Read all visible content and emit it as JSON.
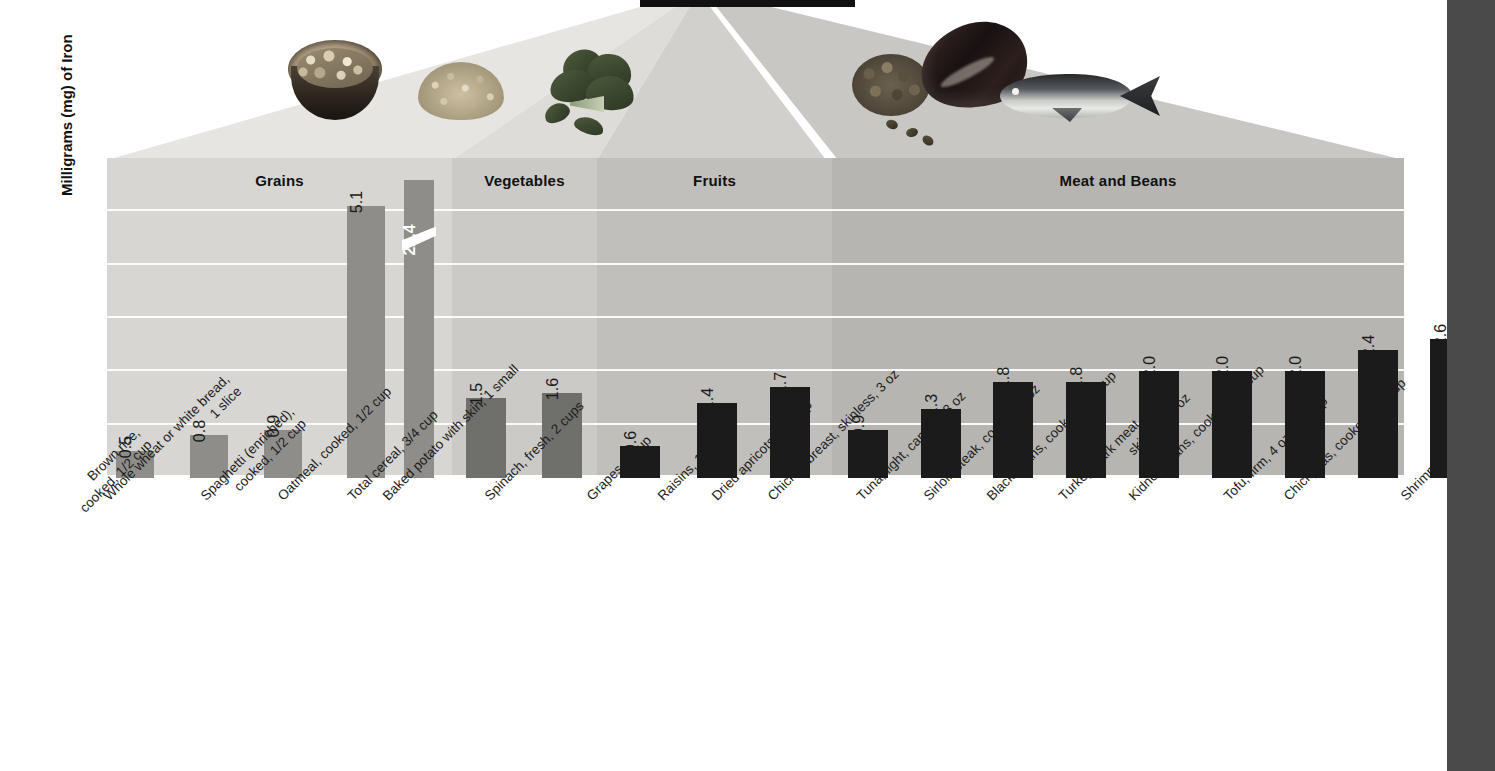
{
  "chart_data": {
    "type": "bar",
    "title": "",
    "ylabel": "Milligrams (mg) of Iron",
    "xlabel": "",
    "ylim": [
      0,
      6
    ],
    "grid": true,
    "axis_break": {
      "present": true,
      "bar_index": 4,
      "note": "Total cereal bar is truncated with a diagonal break"
    },
    "groups": [
      {
        "name": "Grains",
        "count": 5
      },
      {
        "name": "Vegetables",
        "count": 2
      },
      {
        "name": "Fruits",
        "count": 3
      },
      {
        "name": "Meat and Beans",
        "count": 10
      }
    ],
    "categories": [
      "Brown rice, cooked, 1/2 cup",
      "Whole wheat or white bread, 1 slice",
      "Spaghetti (enriched), cooked, 1/2 cup",
      "Oatmeal, cooked, 1/2 cup",
      "Total cereal, 3/4 cup",
      "Baked potato with skin, 1 small",
      "Spinach, fresh, 2 cups",
      "Grapes, 1 cup",
      "Raisins, 1/2 cup",
      "Dried apricots, 1/2 cup",
      "Chicken breast, skinless, 3 oz",
      "Tuna, light, canned, 3 oz",
      "Sirloin steak, cooked, 3 oz",
      "Black beans, cooked, 1/2 cup",
      "Turkey, dark meat, cooked, skinless, 3 oz",
      "Kidney beans, cooked, 1/2 cup",
      "Tofu, firm, 4 oz, 1/2 cup",
      "Chickpeas, cooked, 1/2 cup",
      "Shrimp, 3 oz"
    ],
    "values": [
      0.5,
      0.8,
      0.9,
      5.1,
      22.4,
      1.5,
      1.6,
      0.6,
      1.4,
      1.7,
      0.9,
      1.3,
      1.8,
      1.8,
      2.0,
      2.0,
      2.0,
      2.4,
      2.6
    ],
    "value_labels": [
      "0.5",
      "0.8",
      "0.9",
      "5.1",
      "22.4",
      "1.5",
      "1.6",
      "0.6",
      "1.4",
      "1.7",
      "0.9",
      "1.3",
      "1.8",
      "1.8",
      "2.0",
      "2.0",
      "2.0",
      "2.4",
      "2.6"
    ]
  },
  "category_labels_wrapped": [
    [
      "Brown rice,",
      "cooked, 1/2 cup"
    ],
    [
      "Whole wheat or white bread,",
      "1 slice"
    ],
    [
      "Spaghetti (enriched),",
      "cooked, 1/2 cup"
    ],
    [
      "Oatmeal, cooked, 1/2 cup"
    ],
    [
      "Total cereal, 3/4 cup"
    ],
    [
      "Baked potato with skin, 1 small"
    ],
    [
      "Spinach, fresh, 2 cups"
    ],
    [
      "Grapes, 1 cup"
    ],
    [
      "Raisins, 1/2 cup"
    ],
    [
      "Dried apricots, 1/2 cup"
    ],
    [
      "Chicken breast, skinless, 3 oz"
    ],
    [
      "Tuna, light, canned, 3 oz"
    ],
    [
      "Sirloin steak, cooked, 3 oz"
    ],
    [
      "Black beans, cooked, 1/2 cup"
    ],
    [
      "Turkey, dark meat, cooked,",
      "skinless, 3 oz"
    ],
    [
      "Kidney beans, cooked, 1/2 cup"
    ],
    [
      "Tofu, firm, 4 oz, 1/2 cup"
    ],
    [
      "Chickpeas, cooked, 1/2 cup"
    ],
    [
      "Shrimp, 3 oz"
    ]
  ],
  "colors": {
    "grains_panel": "#d7d6d2",
    "vegetables_panel": "#cbcac6",
    "fruits_panel": "#c0bfbb",
    "meat_panel": "#b6b5b1",
    "grains_bar": "#8e8d89",
    "vegetables_bar": "#6f6f6c",
    "dark_bar": "#1b1b1b",
    "gridline": "#ffffff",
    "text": "#111111",
    "page_edge": "#4a4a4a"
  },
  "food_photos": [
    {
      "name": "cereal-bowl-photo",
      "group": "Grains"
    },
    {
      "name": "grain-pile-photo",
      "group": "Grains"
    },
    {
      "name": "spinach-photo",
      "group": "Vegetables"
    },
    {
      "name": "beans-photo",
      "group": "Meat and Beans"
    },
    {
      "name": "meat-photo",
      "group": "Meat and Beans"
    },
    {
      "name": "fish-photo",
      "group": "Meat and Beans"
    }
  ]
}
